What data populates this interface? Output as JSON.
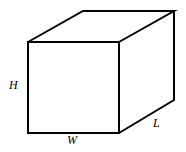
{
  "diagram": {
    "labels": {
      "height": "H",
      "width": "W",
      "length": "L"
    },
    "colors": {
      "stroke": "#000000",
      "background": "#ffffff"
    }
  }
}
